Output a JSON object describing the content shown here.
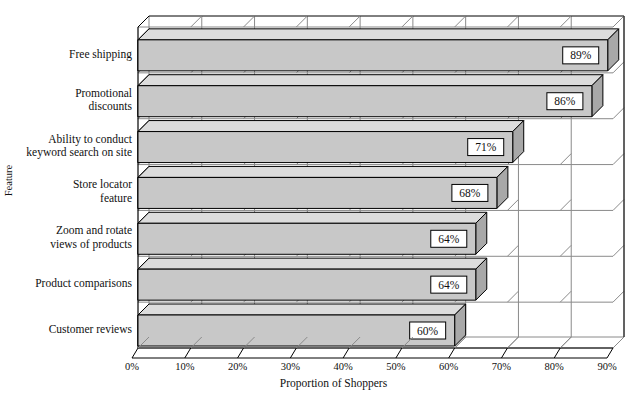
{
  "chart_data": {
    "type": "bar",
    "orientation": "horizontal",
    "style": "3d",
    "title": "",
    "xlabel": "Proportion of Shoppers",
    "ylabel": "Feature",
    "categories": [
      "Free shipping",
      "Promotional\ndiscounts",
      "Ability to conduct\nkeyword search on site",
      "Store locator\nfeature",
      "Zoom and rotate\nviews of products",
      "Product comparisons",
      "Customer reviews"
    ],
    "values": [
      89,
      86,
      71,
      68,
      64,
      64,
      60
    ],
    "data_labels": [
      "89%",
      "86%",
      "71%",
      "68%",
      "64%",
      "64%",
      "60%"
    ],
    "xticks": [
      0,
      10,
      20,
      30,
      40,
      50,
      60,
      70,
      80,
      90
    ],
    "xtick_labels": [
      "0%",
      "10%",
      "20%",
      "30%",
      "40%",
      "50%",
      "60%",
      "70%",
      "80%",
      "90%"
    ],
    "xlim": [
      0,
      90
    ],
    "grid": true,
    "legend": null,
    "colors": {
      "bar_front": "#c8c8c8",
      "bar_top": "#dcdcdc",
      "bar_side": "#a8a8a8",
      "bar_cap": "#000000",
      "outline": "#000000",
      "grid": "#8a8a8a",
      "label_box_fill": "#ffffff",
      "background": "#ffffff"
    }
  }
}
